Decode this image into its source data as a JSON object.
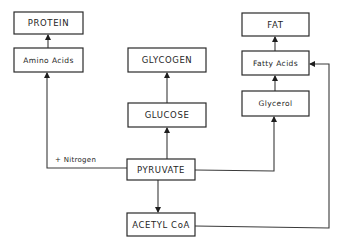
{
  "diagram": {
    "type": "metabolic-pathway-flowchart",
    "colors": {
      "stroke": "#2a2a2a",
      "text": "#1e1e1e",
      "background": "#ffffff"
    },
    "nodes": {
      "protein": {
        "label": "PROTEIN"
      },
      "amino_acids": {
        "label": "Amino Acids"
      },
      "glycogen": {
        "label": "GLYCOGEN"
      },
      "glucose": {
        "label": "GLUCOSE"
      },
      "fat": {
        "label": "FAT"
      },
      "fatty_acids": {
        "label": "Fatty Acids"
      },
      "glycerol": {
        "label": "Glycerol"
      },
      "pyruvate": {
        "label": "PYRUVATE"
      },
      "acetyl_coa": {
        "label": "ACETYL CoA"
      }
    },
    "edges": [
      {
        "from": "Amino Acids",
        "to": "PROTEIN"
      },
      {
        "from": "GLUCOSE",
        "to": "GLYCOGEN"
      },
      {
        "from": "Fatty Acids",
        "to": "FAT"
      },
      {
        "from": "Glycerol",
        "to": "Fatty Acids"
      },
      {
        "from": "PYRUVATE",
        "to": "GLUCOSE"
      },
      {
        "from": "PYRUVATE",
        "to": "Amino Acids",
        "label": "+ Nitrogen"
      },
      {
        "from": "PYRUVATE",
        "to": "Glycerol"
      },
      {
        "from": "PYRUVATE",
        "to": "ACETYL CoA"
      },
      {
        "from": "ACETYL CoA",
        "to": "Fatty Acids"
      }
    ],
    "edge_labels": {
      "nitrogen": "+ Nitrogen"
    }
  }
}
